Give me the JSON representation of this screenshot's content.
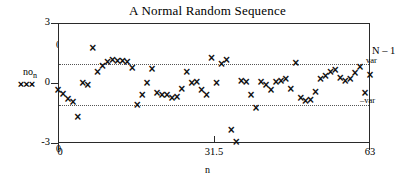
{
  "chart_data": {
    "type": "scatter",
    "title": "A Normal Random Sequence",
    "xlabel": "n",
    "ylabel": "no",
    "ylabel_sub": "n",
    "xlim": [
      0,
      63
    ],
    "ylim": [
      -3,
      3
    ],
    "grid": false,
    "x_ticks": [
      "0",
      "31.5",
      "63"
    ],
    "x_tick_values": [
      0,
      31.5,
      63
    ],
    "y_ticks": [
      "3",
      "0",
      "-3"
    ],
    "y_tick_values": [
      3,
      0,
      -3
    ],
    "marker": "x",
    "marker_color": "#111111",
    "reference_lines": [
      {
        "label": "var",
        "value": 1.02,
        "style": "dotted"
      },
      {
        "label": "-var",
        "value": -1.07,
        "style": "dotted"
      }
    ],
    "annotations": [
      {
        "name": "sequence-length",
        "text": "N – 1"
      },
      {
        "name": "variance-upper",
        "text": "var"
      },
      {
        "name": "variance-lower",
        "text": "–var"
      },
      {
        "name": "stray-zero-top",
        "text": "0"
      },
      {
        "name": "stray-zero-bottom",
        "text": "0"
      }
    ],
    "legend_marks": "×××",
    "x": [
      0,
      1,
      2,
      3,
      4,
      5,
      6,
      7,
      8,
      9,
      10,
      11,
      12,
      13,
      14,
      15,
      16,
      17,
      18,
      19,
      20,
      21,
      22,
      23,
      24,
      25,
      26,
      27,
      28,
      29,
      30,
      31,
      32,
      33,
      34,
      35,
      36,
      37,
      38,
      39,
      40,
      41,
      42,
      43,
      44,
      45,
      46,
      47,
      48,
      49,
      50,
      51,
      52,
      53,
      54,
      55,
      56,
      57,
      58,
      59,
      60,
      61,
      62,
      63
    ],
    "values": [
      -0.35,
      -0.55,
      -0.8,
      -0.95,
      -1.7,
      -0.02,
      -0.12,
      1.75,
      0.55,
      0.85,
      1.05,
      1.12,
      1.1,
      1.08,
      1.02,
      0.72,
      -1.1,
      -0.6,
      -0.02,
      0.7,
      -0.52,
      -0.62,
      -0.6,
      -0.75,
      -0.7,
      -0.3,
      0.55,
      -0.02,
      0.04,
      -0.35,
      -0.62,
      1.25,
      -0.04,
      0.95,
      1.12,
      -2.35,
      -2.95,
      0.1,
      0.02,
      -0.6,
      -1.25,
      0.05,
      -0.12,
      -0.35,
      0.02,
      0.06,
      0.2,
      -0.3,
      1.0,
      -0.75,
      -0.9,
      -0.85,
      -0.45,
      0.2,
      0.35,
      0.55,
      0.65,
      0.25,
      0.1,
      0.2,
      0.5,
      0.8,
      -0.5,
      0.4
    ]
  }
}
